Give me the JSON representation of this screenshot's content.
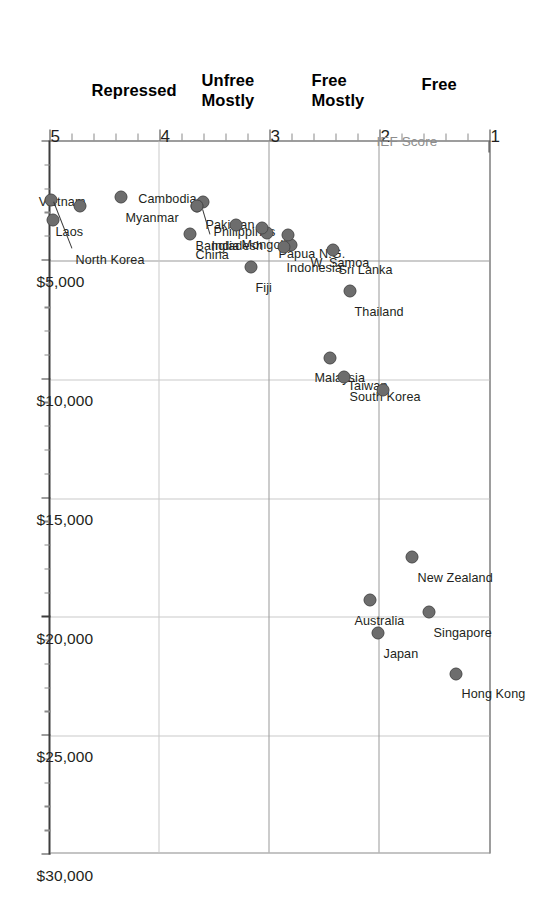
{
  "figure": {
    "orientation": "rotated-90-ccw",
    "value_axis_title": "",
    "score_axis_title": "IEF Score"
  },
  "chart_data": {
    "type": "scatter",
    "title": "",
    "subtitle": "",
    "xlabel": "IEF Score",
    "ylabel": "",
    "orientation": "score on vertical page axis, GDP per capita on horizontal page axis",
    "score_axis": {
      "label": "IEF Score",
      "ticks": [
        "1",
        "2",
        "3",
        "4",
        "5"
      ],
      "tick_values": [
        1,
        2,
        3,
        4,
        5
      ],
      "minor_ticks_per_interval": 4,
      "range": [
        1,
        5
      ],
      "gridlines_at": [
        2,
        3,
        4
      ],
      "bands": [
        {
          "label": "Free",
          "from": 1,
          "to": 2
        },
        {
          "label": "Mostly\nFree",
          "from": 2,
          "to": 3
        },
        {
          "label": "Mostly\nUnfree",
          "from": 3,
          "to": 4
        },
        {
          "label": "Repressed",
          "from": 4,
          "to": 5
        }
      ]
    },
    "value_axis": {
      "label": "",
      "ticks": [
        "$5,000",
        "$10,000",
        "$15,000",
        "$20,000",
        "$25,000",
        "$30,000"
      ],
      "tick_values": [
        5000,
        10000,
        15000,
        20000,
        25000,
        30000
      ],
      "range": [
        0,
        30000
      ],
      "minor_ticks_per_interval": 4
    },
    "grid": true,
    "legend": null,
    "points": [
      {
        "name": "Hong Kong",
        "score": 1.3,
        "value": 22400
      },
      {
        "name": "Singapore",
        "score": 1.55,
        "value": 19800
      },
      {
        "name": "New Zealand",
        "score": 1.7,
        "value": 17500
      },
      {
        "name": "Japan",
        "score": 2.01,
        "value": 20700
      },
      {
        "name": "Australia",
        "score": 2.09,
        "value": 19300
      },
      {
        "name": "Taiwan",
        "score": 1.97,
        "value": 10450
      },
      {
        "name": "South Korea",
        "score": 2.32,
        "value": 9900
      },
      {
        "name": "Malaysia",
        "score": 2.45,
        "value": 9100
      },
      {
        "name": "Thailand",
        "score": 2.27,
        "value": 6300
      },
      {
        "name": "Sri Lanka",
        "score": 2.42,
        "value": 4550
      },
      {
        "name": "W. Samoa",
        "score": 2.8,
        "value": 4350
      },
      {
        "name": "Indonesia",
        "score": 2.87,
        "value": 4450
      },
      {
        "name": "Philippines",
        "score": 2.83,
        "value": 3950
      },
      {
        "name": "Papua N.G.",
        "score": 3.02,
        "value": 3850
      },
      {
        "name": "Pakistan",
        "score": 3.07,
        "value": 3650
      },
      {
        "name": "Fiji",
        "score": 3.17,
        "value": 5300
      },
      {
        "name": "Mongolia",
        "score": 3.3,
        "value": 3500
      },
      {
        "name": "Cambodia",
        "score": 3.6,
        "value": 2550
      },
      {
        "name": "India",
        "score": 3.66,
        "value": 2700
      },
      {
        "name": "Bangladesh",
        "score": 3.66,
        "value": 2700
      },
      {
        "name": "China",
        "score": 3.72,
        "value": 3900
      },
      {
        "name": "Myanmar",
        "score": 4.35,
        "value": 2350
      },
      {
        "name": "Vietnam",
        "score": 4.72,
        "value": 2700
      },
      {
        "name": "North Korea",
        "score": 4.97,
        "value": 3300
      },
      {
        "name": "Laos",
        "score": 4.99,
        "value": 2450
      }
    ]
  },
  "score_ticks": {
    "t1": "1",
    "t2": "2",
    "t3": "3",
    "t4": "4",
    "t5": "5"
  },
  "money_ticks": {
    "m5": "$5,000",
    "m10": "$10,000",
    "m15": "$15,000",
    "m20": "$20,000",
    "m25": "$25,000",
    "m30": "$30,000"
  },
  "bands": {
    "free": "Free",
    "mostly_free_l1": "Mostly",
    "mostly_free_l2": "Free",
    "mostly_unfree_l1": "Mostly",
    "mostly_unfree_l2": "Unfree",
    "repressed": "Repressed"
  },
  "axis": {
    "score_title": "IEF Score"
  },
  "labels": {
    "hong_kong": "Hong Kong",
    "singapore": "Singapore",
    "new_zealand": "New Zealand",
    "japan": "Japan",
    "australia": "Australia",
    "taiwan": "Taiwan",
    "south_korea": "South Korea",
    "malaysia": "Malaysia",
    "thailand": "Thailand",
    "sri_lanka": "Sri Lanka",
    "w_samoa": "W. Samoa",
    "indonesia": "Indonesia",
    "philippines": "Philippines",
    "papua_ng": "Papua N.G.",
    "pakistan": "Pakistan",
    "fiji": "Fiji",
    "mongolia": "Mongolia",
    "cambodia": "Cambodia",
    "india": "India",
    "bangladesh": "Bangladesh",
    "china": "China",
    "myanmar": "Myanmar",
    "vietnam": "Vietnam",
    "north_korea": "North Korea",
    "laos": "Laos"
  },
  "colors": {
    "marker": "#6d6d6d",
    "marker_edge": "#4a4a4a",
    "frame": "#3d3d3d",
    "grid": "#9a9a9a",
    "axis_title": "#8d8d8d",
    "text": "#231f20"
  }
}
